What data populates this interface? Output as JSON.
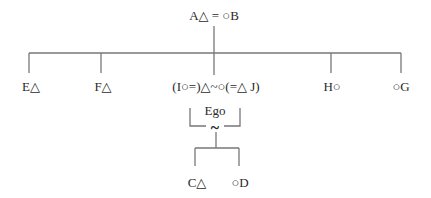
{
  "diagram": {
    "type": "kinship-chart",
    "parents": {
      "label": "A△ = ○B"
    },
    "siblings": [
      {
        "id": "E",
        "label": "E△"
      },
      {
        "id": "F",
        "label": "F△"
      },
      {
        "id": "ego-couple",
        "label": "(I○=)△~○(=△ J)"
      },
      {
        "id": "H",
        "label": "H○"
      },
      {
        "id": "G",
        "label": "○G"
      }
    ],
    "ego": {
      "label": "Ego",
      "marriage_symbol": "~"
    },
    "children": [
      {
        "id": "C",
        "label": "C△"
      },
      {
        "id": "D",
        "label": "○D"
      }
    ],
    "line_color": "#777777"
  }
}
